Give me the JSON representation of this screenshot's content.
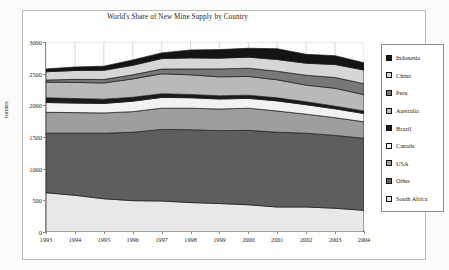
{
  "chart_data": {
    "type": "area",
    "title": "World's Share of New Mine Supply by Country",
    "xlabel": "",
    "ylabel": "tonnes",
    "stacked": true,
    "grid": true,
    "legend_position": "right",
    "ylim": [
      0,
      3000
    ],
    "yticks": [
      0,
      500,
      1000,
      1500,
      2000,
      2500,
      3000
    ],
    "categories": [
      "1993",
      "1994",
      "1995",
      "1996",
      "1997",
      "1998",
      "1999",
      "2000",
      "2001",
      "2002",
      "2003",
      "2004"
    ],
    "stack_order_bottom_to_top": [
      "South Africa",
      "Other",
      "USA",
      "Canada",
      "Brazil",
      "Australia",
      "Peru",
      "China",
      "Indonesia"
    ],
    "series": [
      {
        "name": "South Africa",
        "color": "#e8e8e8",
        "values": [
          620,
          580,
          525,
          495,
          490,
          465,
          450,
          430,
          395,
          395,
          375,
          342
        ]
      },
      {
        "name": "Other",
        "color": "#5e5e5e",
        "values": [
          940,
          980,
          1035,
          1080,
          1130,
          1150,
          1150,
          1175,
          1180,
          1165,
          1150,
          1138
        ]
      },
      {
        "name": "USA",
        "color": "#9e9e9e",
        "values": [
          330,
          325,
          320,
          325,
          335,
          340,
          342,
          350,
          335,
          300,
          280,
          260
        ]
      },
      {
        "name": "Canada",
        "color": "#f2f2f2",
        "values": [
          155,
          150,
          150,
          165,
          170,
          165,
          158,
          155,
          160,
          150,
          140,
          130
        ]
      },
      {
        "name": "Brazil",
        "color": "#1c1c1c",
        "values": [
          75,
          72,
          68,
          62,
          58,
          52,
          50,
          50,
          48,
          45,
          42,
          40
        ]
      },
      {
        "name": "Australia",
        "color": "#b9b9b9",
        "values": [
          245,
          255,
          255,
          290,
          315,
          310,
          300,
          296,
          285,
          265,
          282,
          259
        ]
      },
      {
        "name": "Peru",
        "color": "#787878",
        "values": [
          35,
          48,
          55,
          65,
          75,
          92,
          125,
          130,
          135,
          155,
          170,
          173
        ]
      },
      {
        "name": "China",
        "color": "#d6d6d6",
        "values": [
          130,
          140,
          145,
          150,
          165,
          175,
          170,
          175,
          185,
          190,
          205,
          215
        ]
      },
      {
        "name": "Indonesia",
        "color": "#141414",
        "values": [
          45,
          55,
          65,
          85,
          90,
          125,
          135,
          140,
          170,
          140,
          140,
          115
        ]
      }
    ]
  },
  "legend": {
    "items": [
      {
        "label": "Indonesia",
        "swatch": "#141414"
      },
      {
        "label": "China",
        "swatch": "#d6d6d6"
      },
      {
        "label": "Peru",
        "swatch": "#787878"
      },
      {
        "label": "Australia",
        "swatch": "#b9b9b9"
      },
      {
        "label": "Brazil",
        "swatch": "#1c1c1c"
      },
      {
        "label": "Canada",
        "swatch": "#f2f2f2"
      },
      {
        "label": "USA",
        "swatch": "#9e9e9e"
      },
      {
        "label": "Other",
        "swatch": "#5e5e5e"
      },
      {
        "label": "South Africa",
        "swatch": "#e8e8e8"
      }
    ]
  }
}
